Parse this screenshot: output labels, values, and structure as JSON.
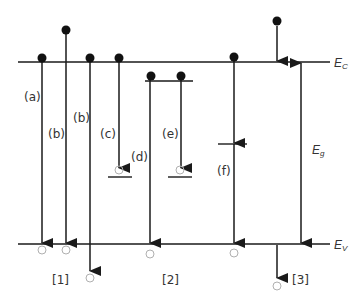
{
  "diagram": {
    "levels": {
      "conduction_band": "E",
      "conduction_sub": "C",
      "valence_band": "E",
      "valence_sub": "V",
      "gap": "E",
      "gap_sub": "g"
    },
    "transition_labels": [
      "(a)",
      "(b)",
      "(b)",
      "(c)",
      "(d)",
      "(e)",
      "(f)"
    ],
    "group_labels": [
      "[1]",
      "[2]",
      "[3]"
    ],
    "colors": {
      "line": "#1a1a1a",
      "hole": "#b0b0b0",
      "text": "#333333"
    }
  }
}
